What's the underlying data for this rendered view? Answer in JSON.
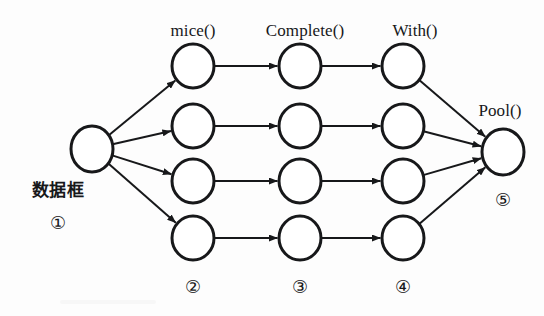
{
  "figure": {
    "kind": "pipeline-flow-diagram",
    "background_color": "#fdfdfd",
    "ink_color": "#17181a",
    "node_fill": "#ffffff",
    "node_stroke_width": 3,
    "edge_stroke_width": 2,
    "width": 544,
    "height": 316
  },
  "stage_labels": {
    "stage2": "mice()",
    "stage3": "Complete()",
    "stage4": "With()",
    "stage5": "Pool()",
    "stage1": "数据框"
  },
  "step_markers": {
    "one": "①",
    "two": "②",
    "three": "③",
    "four": "④",
    "five": "⑤"
  },
  "nodes": [
    {
      "id": "source",
      "label_ref": "数据框",
      "cx": 92,
      "cy": 149,
      "rx": 21,
      "ry": 23
    },
    {
      "id": "c2r1",
      "label_ref": "mice()",
      "cx": 193,
      "cy": 66,
      "rx": 21,
      "ry": 22
    },
    {
      "id": "c2r2",
      "label_ref": "mice()",
      "cx": 193,
      "cy": 126,
      "rx": 21,
      "ry": 22
    },
    {
      "id": "c2r3",
      "label_ref": "mice()",
      "cx": 193,
      "cy": 181,
      "rx": 21,
      "ry": 22
    },
    {
      "id": "c2r4",
      "label_ref": "mice()",
      "cx": 193,
      "cy": 238,
      "rx": 21,
      "ry": 22
    },
    {
      "id": "c3r1",
      "label_ref": "Complete()",
      "cx": 300,
      "cy": 66,
      "rx": 21,
      "ry": 22
    },
    {
      "id": "c3r2",
      "label_ref": "Complete()",
      "cx": 300,
      "cy": 126,
      "rx": 21,
      "ry": 22
    },
    {
      "id": "c3r3",
      "label_ref": "Complete()",
      "cx": 300,
      "cy": 181,
      "rx": 21,
      "ry": 22
    },
    {
      "id": "c3r4",
      "label_ref": "Complete()",
      "cx": 300,
      "cy": 238,
      "rx": 21,
      "ry": 22
    },
    {
      "id": "c4r1",
      "label_ref": "With()",
      "cx": 403,
      "cy": 66,
      "rx": 21,
      "ry": 22
    },
    {
      "id": "c4r2",
      "label_ref": "With()",
      "cx": 403,
      "cy": 126,
      "rx": 21,
      "ry": 22
    },
    {
      "id": "c4r3",
      "label_ref": "With()",
      "cx": 403,
      "cy": 181,
      "rx": 21,
      "ry": 22
    },
    {
      "id": "c4r4",
      "label_ref": "With()",
      "cx": 403,
      "cy": 238,
      "rx": 21,
      "ry": 22
    },
    {
      "id": "pool",
      "label_ref": "Pool()",
      "cx": 503,
      "cy": 152,
      "rx": 21,
      "ry": 23
    }
  ],
  "edges": [
    {
      "from": "source",
      "to": "c2r1",
      "kind": "fan-out"
    },
    {
      "from": "source",
      "to": "c2r2",
      "kind": "fan-out"
    },
    {
      "from": "source",
      "to": "c2r3",
      "kind": "fan-out"
    },
    {
      "from": "source",
      "to": "c2r4",
      "kind": "fan-out"
    },
    {
      "from": "c2r1",
      "to": "c3r1",
      "kind": "straight"
    },
    {
      "from": "c2r2",
      "to": "c3r2",
      "kind": "straight"
    },
    {
      "from": "c2r3",
      "to": "c3r3",
      "kind": "straight"
    },
    {
      "from": "c2r4",
      "to": "c3r4",
      "kind": "straight"
    },
    {
      "from": "c3r1",
      "to": "c4r1",
      "kind": "straight"
    },
    {
      "from": "c3r2",
      "to": "c4r2",
      "kind": "straight"
    },
    {
      "from": "c3r3",
      "to": "c4r3",
      "kind": "straight"
    },
    {
      "from": "c3r4",
      "to": "c4r4",
      "kind": "straight"
    },
    {
      "from": "c4r1",
      "to": "pool",
      "kind": "fan-in"
    },
    {
      "from": "c4r2",
      "to": "pool",
      "kind": "fan-in"
    },
    {
      "from": "c4r3",
      "to": "pool",
      "kind": "fan-in"
    },
    {
      "from": "c4r4",
      "to": "pool",
      "kind": "fan-in"
    }
  ],
  "label_positions": {
    "mice": {
      "x": 193,
      "y": 30
    },
    "complete": {
      "x": 305,
      "y": 30
    },
    "with": {
      "x": 415,
      "y": 30
    },
    "pool": {
      "x": 500,
      "y": 110
    },
    "dataframe": {
      "x": 58,
      "y": 190
    },
    "num1": {
      "x": 58,
      "y": 223
    },
    "num2": {
      "x": 193,
      "y": 287
    },
    "num3": {
      "x": 300,
      "y": 287
    },
    "num4": {
      "x": 403,
      "y": 287
    },
    "num5": {
      "x": 503,
      "y": 200
    }
  }
}
